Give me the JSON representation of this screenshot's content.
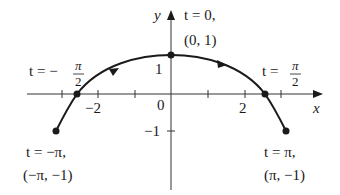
{
  "diagram": {
    "type": "parametric-curve",
    "axes": {
      "x_label": "x",
      "y_label": "y",
      "origin_label": "0",
      "x_tick_labels": [
        "−2",
        "2"
      ],
      "y_tick_labels": [
        "1",
        "−1"
      ]
    },
    "points": [
      {
        "id": "start",
        "t_label": "t = −π,",
        "coord_label": "(−π, −1)"
      },
      {
        "id": "neg-half-pi",
        "t_prefix": "t = −",
        "frac_num": "π",
        "frac_den": "2"
      },
      {
        "id": "zero",
        "t_label": "t = 0,",
        "coord_label": "(0, 1)"
      },
      {
        "id": "half-pi",
        "t_prefix": "t = ",
        "frac_num": "π",
        "frac_den": "2"
      },
      {
        "id": "end",
        "t_label": "t = π,",
        "coord_label": "(π, −1)"
      }
    ],
    "colors": {
      "ink": "#1a1a1a",
      "background": "#ffffff"
    }
  }
}
